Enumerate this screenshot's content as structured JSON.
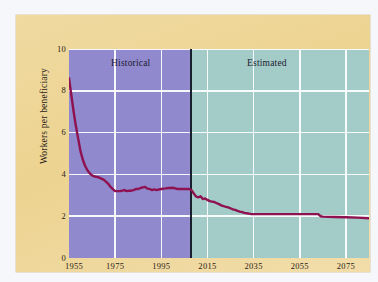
{
  "figure": {
    "panel_bg": "#eed697",
    "page_bg": "#f6f7fb"
  },
  "chart_data": {
    "type": "line",
    "title": "",
    "subtitle": "",
    "xlabel": "",
    "ylabel": "Workers per beneficiary",
    "xlim": [
      1955,
      2085
    ],
    "ylim": [
      0,
      10
    ],
    "grid": true,
    "legend_position": "in-plot-top",
    "annotations": [
      {
        "text": "Historical",
        "x": 1975,
        "y": 9.4
      },
      {
        "text": "Estimated",
        "x": 2043,
        "y": 9.4
      }
    ],
    "divider": {
      "x": 2008,
      "label": "historical/estimated boundary",
      "color": "#18202c"
    },
    "regions": [
      {
        "name": "Historical",
        "from": 1955,
        "to": 2008,
        "color": "#9089ce"
      },
      {
        "name": "Estimated",
        "from": 2008,
        "to": 2085,
        "color": "#a3ccc9"
      }
    ],
    "xticks": [
      1955,
      1975,
      1995,
      2015,
      2035,
      2055,
      2075
    ],
    "xtick_labels": [
      "1955",
      "1975",
      "1995",
      "2015",
      "2035",
      "2055",
      "2075"
    ],
    "yticks": [
      0,
      2,
      4,
      6,
      8,
      10
    ],
    "ytick_labels": [
      "0",
      "2",
      "4",
      "6",
      "8",
      "10"
    ],
    "series": [
      {
        "name": "Workers per beneficiary",
        "color": "#8e1150",
        "x": [
          1955,
          1956,
          1957,
          1958,
          1959,
          1960,
          1961,
          1962,
          1963,
          1964,
          1965,
          1966,
          1967,
          1968,
          1969,
          1970,
          1971,
          1972,
          1973,
          1974,
          1975,
          1976,
          1977,
          1978,
          1979,
          1980,
          1981,
          1982,
          1983,
          1984,
          1985,
          1986,
          1987,
          1988,
          1989,
          1990,
          1991,
          1992,
          1993,
          1994,
          1995,
          1996,
          1997,
          1998,
          1999,
          2000,
          2001,
          2002,
          2003,
          2004,
          2005,
          2006,
          2007,
          2008,
          2009,
          2010,
          2011,
          2012,
          2013,
          2014,
          2015,
          2016,
          2017,
          2018,
          2019,
          2020,
          2021,
          2022,
          2023,
          2024,
          2025,
          2026,
          2027,
          2028,
          2029,
          2030,
          2031,
          2032,
          2033,
          2034,
          2035,
          2040,
          2045,
          2050,
          2055,
          2060,
          2063,
          2064,
          2065,
          2070,
          2075,
          2080,
          2085
        ],
        "y": [
          8.6,
          7.8,
          7.0,
          6.3,
          5.7,
          5.1,
          4.7,
          4.4,
          4.2,
          4.05,
          3.95,
          3.9,
          3.88,
          3.85,
          3.8,
          3.75,
          3.65,
          3.55,
          3.4,
          3.3,
          3.2,
          3.2,
          3.2,
          3.22,
          3.25,
          3.2,
          3.22,
          3.22,
          3.25,
          3.3,
          3.3,
          3.35,
          3.38,
          3.4,
          3.32,
          3.3,
          3.25,
          3.28,
          3.25,
          3.28,
          3.3,
          3.32,
          3.33,
          3.35,
          3.35,
          3.36,
          3.33,
          3.3,
          3.3,
          3.3,
          3.3,
          3.3,
          3.3,
          3.25,
          3.1,
          2.95,
          2.9,
          2.95,
          2.82,
          2.85,
          2.78,
          2.72,
          2.7,
          2.68,
          2.62,
          2.58,
          2.52,
          2.48,
          2.45,
          2.42,
          2.38,
          2.33,
          2.3,
          2.26,
          2.22,
          2.2,
          2.16,
          2.14,
          2.12,
          2.1,
          2.1,
          2.1,
          2.1,
          2.1,
          2.1,
          2.1,
          2.1,
          2.0,
          1.98,
          1.96,
          1.95,
          1.93,
          1.9
        ]
      }
    ]
  }
}
